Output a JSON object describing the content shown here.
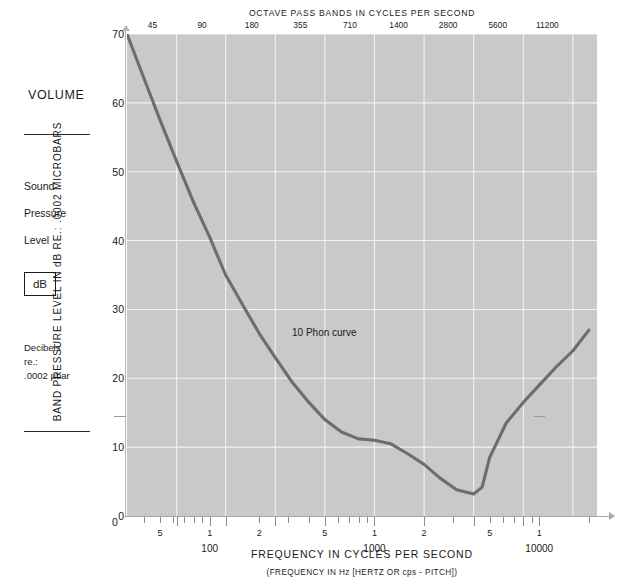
{
  "sidebar": {
    "volume_label": "VOLUME",
    "sound_label": "Sound",
    "pressure_label": "Pressure",
    "level_label": "Level",
    "db_badge": "dB",
    "decibels_line1": "Decibels",
    "decibels_line2": "re.:",
    "decibels_line3": ".0002 µbar"
  },
  "axes": {
    "y_title": "BAND PRESSURE LEVEL IN dB RE.: .0002 MICROBARS",
    "top_title": "OCTAVE PASS BANDS IN CYCLES PER SECOND",
    "x_title": "FREQUENCY IN CYCLES PER SECOND",
    "x_subtitle": "(FREQUENCY IN Hz [HERTZ OR cps - PITCH])",
    "zero_label": "0"
  },
  "annotations": [
    {
      "text": "10 Phon curve",
      "left": 292,
      "top": 327
    }
  ],
  "colors": {
    "plot_background": "#c9c9c9",
    "gridline": "#f2f2f2",
    "curve": "#6d6d6d",
    "text": "#1a1a1a",
    "axis": "#a8a8a8"
  },
  "chart_data": {
    "type": "line",
    "xlabel": "FREQUENCY IN CYCLES PER SECOND",
    "ylabel": "BAND PRESSURE LEVEL IN dB RE.: .0002 MICROBARS",
    "xscale": "log",
    "xlim": [
      31.5,
      22400
    ],
    "ylim": [
      0,
      70
    ],
    "grid": true,
    "legend": "none",
    "y_ticks": [
      0,
      10,
      20,
      30,
      40,
      50,
      60,
      70
    ],
    "x_major_ticks": [
      63,
      125,
      250,
      500,
      1000,
      2000,
      4000,
      8000
    ],
    "x_decade_labels": [
      {
        "value": 100,
        "label": "100"
      },
      {
        "value": 1000,
        "label": "1000"
      },
      {
        "value": 10000,
        "label": "10000"
      }
    ],
    "x_mantissa_labels": [
      {
        "value": 50,
        "label": "5"
      },
      {
        "value": 100,
        "label": "1"
      },
      {
        "value": 200,
        "label": "2"
      },
      {
        "value": 500,
        "label": "5"
      },
      {
        "value": 1000,
        "label": "1"
      },
      {
        "value": 2000,
        "label": "2"
      },
      {
        "value": 5000,
        "label": "5"
      },
      {
        "value": 10000,
        "label": "1"
      }
    ],
    "octave_pass_bands": [
      45,
      90,
      180,
      355,
      710,
      1400,
      2800,
      5600,
      11200
    ],
    "series": [
      {
        "name": "10 Phon curve",
        "x": [
          31.5,
          40,
          50,
          63,
          80,
          100,
          125,
          160,
          200,
          250,
          315,
          400,
          500,
          630,
          800,
          1000,
          1250,
          1600,
          2000,
          2500,
          3150,
          4000,
          4500,
          5000,
          6300,
          8000,
          10000,
          12500,
          16000,
          20000
        ],
        "y": [
          70.0,
          63.5,
          57.5,
          51.5,
          45.5,
          40.5,
          35.0,
          30.5,
          26.5,
          23.0,
          19.5,
          16.5,
          14.0,
          12.2,
          11.2,
          11.0,
          10.5,
          9.0,
          7.5,
          5.5,
          3.8,
          3.2,
          4.2,
          8.5,
          13.5,
          16.5,
          19.0,
          21.5,
          24.0,
          27.0
        ]
      }
    ]
  }
}
